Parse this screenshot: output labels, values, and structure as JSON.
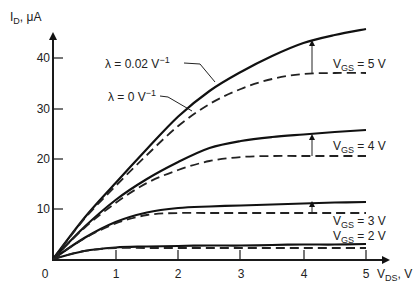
{
  "chart_data": {
    "type": "line",
    "title": "",
    "xlabel": "V_DS, V",
    "ylabel": "I_D, μA",
    "xlim": [
      0,
      5.35
    ],
    "ylim": [
      0,
      47
    ],
    "grid": false,
    "x_ticks": [
      0,
      1,
      2,
      3,
      4,
      5
    ],
    "y_ticks": [
      10,
      20,
      30,
      40
    ],
    "x": [
      0,
      0.5,
      1,
      1.5,
      2,
      2.5,
      3,
      3.5,
      4,
      4.5,
      5
    ],
    "series": [
      {
        "name": "VGS = 5 V, λ = 0.02 V^-1",
        "style": "solid",
        "values": [
          0,
          8.2,
          15.2,
          22.0,
          28.5,
          33.6,
          37.4,
          40.6,
          43.2,
          44.8,
          46.0
        ]
      },
      {
        "name": "VGS = 5 V, λ = 0 V^-1",
        "style": "dashed",
        "values": [
          0,
          8.0,
          14.6,
          20.8,
          26.6,
          31.0,
          34.0,
          36.0,
          37.0,
          37.2,
          37.2
        ]
      },
      {
        "name": "VGS = 4 V, λ = 0.02 V^-1",
        "style": "solid",
        "values": [
          0,
          6.4,
          11.8,
          16.0,
          19.4,
          22.2,
          23.6,
          24.4,
          24.9,
          25.4,
          25.8
        ]
      },
      {
        "name": "VGS = 4 V, λ = 0 V^-1",
        "style": "dashed",
        "values": [
          0,
          6.2,
          11.2,
          15.2,
          17.8,
          19.6,
          20.4,
          20.6,
          20.6,
          20.6,
          20.6
        ]
      },
      {
        "name": "VGS = 3 V, λ = 0.02 V^-1",
        "style": "solid",
        "values": [
          0,
          4.2,
          7.4,
          9.3,
          10.2,
          10.5,
          10.7,
          10.9,
          11.1,
          11.3,
          11.4
        ]
      },
      {
        "name": "VGS = 3 V, λ = 0 V^-1",
        "style": "dashed",
        "values": [
          0,
          4.1,
          7.1,
          8.8,
          9.2,
          9.2,
          9.2,
          9.2,
          9.2,
          9.2,
          9.2
        ]
      },
      {
        "name": "VGS = 2 V, λ = 0.02 V^-1",
        "style": "solid",
        "values": [
          0,
          1.6,
          2.3,
          2.5,
          2.6,
          2.7,
          2.7,
          2.8,
          2.9,
          2.9,
          3.0
        ]
      },
      {
        "name": "VGS = 2 V, λ = 0 V^-1",
        "style": "dashed",
        "values": [
          0,
          1.6,
          2.2,
          2.2,
          2.2,
          2.2,
          2.2,
          2.2,
          2.2,
          2.2,
          2.2
        ]
      }
    ],
    "annotations": [
      {
        "text": "λ = 0.02 V⁻¹",
        "points_to": "VGS = 5 V solid curve"
      },
      {
        "text": "λ = 0 V⁻¹",
        "points_to": "VGS = 5 V dashed curve"
      },
      {
        "text": "VGS = 5 V"
      },
      {
        "text": "VGS = 4 V"
      },
      {
        "text": "VGS = 3 V"
      },
      {
        "text": "VGS = 2 V"
      }
    ]
  },
  "axes": {
    "y_label_main": "I",
    "y_label_sub": "D",
    "y_label_unit": ", μA",
    "x_label_main": "V",
    "x_label_sub": "DS",
    "x_label_unit": ", V",
    "origin_label": "0",
    "x_tick_labels": [
      "1",
      "2",
      "3",
      "4",
      "5"
    ],
    "y_tick_labels": [
      "10",
      "20",
      "30",
      "40"
    ]
  },
  "labels": {
    "lambda_002": "λ = 0.02 V",
    "lambda_002_exp": "−1",
    "lambda_0": "λ = 0 V",
    "lambda_0_exp": "−1",
    "vgs_prefix": "V",
    "vgs_sub": "GS",
    "vgs5_val": " = 5 V",
    "vgs4_val": " = 4 V",
    "vgs3_val": " = 3 V",
    "vgs2_val": " = 2 V"
  }
}
